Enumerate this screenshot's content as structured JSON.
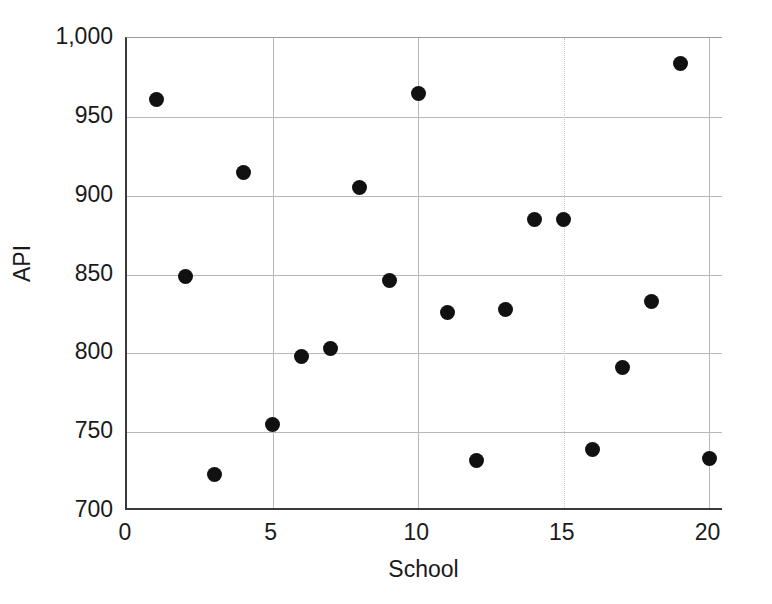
{
  "chart_data": {
    "type": "scatter",
    "title": "",
    "xlabel": "School",
    "ylabel": "API",
    "xlim": [
      0,
      20.5
    ],
    "ylim": [
      700,
      1000
    ],
    "grid": true,
    "legend": null,
    "xticks": [
      "0",
      "5",
      "10",
      "15",
      "20"
    ],
    "xtick_values": [
      0,
      5,
      10,
      15,
      20
    ],
    "yticks": [
      "700",
      "750",
      "800",
      "850",
      "900",
      "950",
      "1,000"
    ],
    "ytick_values": [
      700,
      750,
      800,
      850,
      900,
      950,
      1000
    ],
    "marker": {
      "shape": "circle",
      "color": "#111111",
      "size_px": 15
    },
    "x": [
      1,
      2,
      3,
      4,
      5,
      6,
      7,
      8,
      9,
      10,
      11,
      12,
      13,
      14,
      15,
      16,
      17,
      18,
      19,
      20
    ],
    "values": [
      961,
      849,
      723,
      915,
      755,
      798,
      803,
      905,
      846,
      965,
      826,
      732,
      828,
      885,
      885,
      739,
      791,
      833,
      984,
      733
    ],
    "points": [
      {
        "school": 1,
        "api": 961
      },
      {
        "school": 2,
        "api": 849
      },
      {
        "school": 3,
        "api": 723
      },
      {
        "school": 4,
        "api": 915
      },
      {
        "school": 5,
        "api": 755
      },
      {
        "school": 6,
        "api": 798
      },
      {
        "school": 7,
        "api": 803
      },
      {
        "school": 8,
        "api": 905
      },
      {
        "school": 9,
        "api": 846
      },
      {
        "school": 10,
        "api": 965
      },
      {
        "school": 11,
        "api": 826
      },
      {
        "school": 12,
        "api": 732
      },
      {
        "school": 13,
        "api": 828
      },
      {
        "school": 14,
        "api": 885
      },
      {
        "school": 15,
        "api": 885
      },
      {
        "school": 16,
        "api": 739
      },
      {
        "school": 17,
        "api": 791
      },
      {
        "school": 18,
        "api": 833
      },
      {
        "school": 19,
        "api": 984
      },
      {
        "school": 20,
        "api": 733
      }
    ]
  }
}
